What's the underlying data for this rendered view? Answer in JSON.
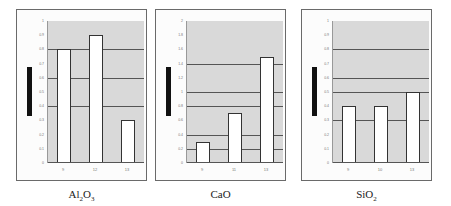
{
  "chart_data": [
    {
      "type": "bar",
      "title": "Al2O3",
      "caption_main": "Al",
      "caption_sub1": "2",
      "caption_mid": "O",
      "caption_sub2": "3",
      "categories": [
        "9",
        "12",
        "13"
      ],
      "values": [
        0.8,
        0.9,
        0.3
      ],
      "ylim": [
        0,
        1
      ],
      "yticks": [
        "0",
        "0.1",
        "0.2",
        "0.3",
        "0.4",
        "0.5",
        "0.6",
        "0.7",
        "0.8",
        "0.9",
        "1"
      ],
      "gridlines": [
        0.4,
        0.6,
        0.8
      ],
      "xlabel": "",
      "ylabel": ""
    },
    {
      "type": "bar",
      "title": "CaO",
      "caption_main": "CaO",
      "categories": [
        "9",
        "11",
        "13"
      ],
      "values": [
        0.3,
        0.7,
        1.5
      ],
      "ylim": [
        0,
        2
      ],
      "yticks": [
        "0",
        "0.2",
        "0.4",
        "0.6",
        "0.8",
        "1",
        "1.2",
        "1.4",
        "1.6",
        "1.8",
        "2"
      ],
      "gridlines": [
        0.2,
        0.4,
        0.8,
        1.0,
        1.4
      ],
      "xlabel": "",
      "ylabel": ""
    },
    {
      "type": "bar",
      "title": "SiO2",
      "caption_main": "SiO",
      "caption_sub1": "2",
      "categories": [
        "9",
        "10",
        "13"
      ],
      "values": [
        0.4,
        0.4,
        0.5
      ],
      "ylim": [
        0,
        1
      ],
      "yticks": [
        "0",
        "0.1",
        "0.2",
        "0.3",
        "0.4",
        "0.5",
        "0.6",
        "0.7",
        "0.8",
        "0.9",
        "1"
      ],
      "gridlines": [
        0.3,
        0.5,
        0.6,
        0.8
      ],
      "xlabel": "",
      "ylabel": ""
    }
  ],
  "colors": {
    "plot_bg": "#d9d9d9",
    "bar_fill": "#ffffff",
    "bar_edge": "#333333",
    "legend_bar": "#111111"
  }
}
